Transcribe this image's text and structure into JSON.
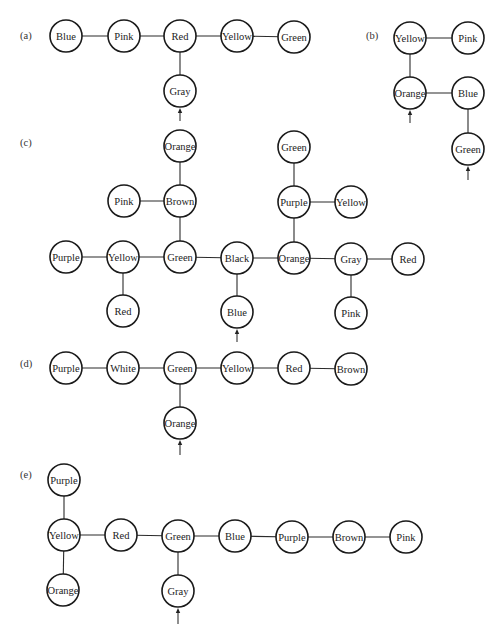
{
  "diagram": {
    "node_radius": 16,
    "panels": [
      {
        "id": "a",
        "label": "(a)",
        "label_pos": [
          20,
          39
        ],
        "nodes": [
          {
            "id": "a1",
            "label": "Blue",
            "x": 66,
            "y": 36
          },
          {
            "id": "a2",
            "label": "Pink",
            "x": 124,
            "y": 36
          },
          {
            "id": "a3",
            "label": "Red",
            "x": 180,
            "y": 36
          },
          {
            "id": "a4",
            "label": "Yellow",
            "x": 237,
            "y": 36
          },
          {
            "id": "a5",
            "label": "Green",
            "x": 294,
            "y": 37
          },
          {
            "id": "a6",
            "label": "Gray",
            "x": 180,
            "y": 91
          }
        ],
        "edges": [
          [
            "a1",
            "a2"
          ],
          [
            "a2",
            "a3"
          ],
          [
            "a3",
            "a4"
          ],
          [
            "a4",
            "a5"
          ],
          [
            "a3",
            "a6"
          ]
        ],
        "arrows": [
          {
            "x": 180,
            "y_top": 108,
            "y_bottom": 121
          }
        ]
      },
      {
        "id": "b",
        "label": "(b)",
        "label_pos": [
          366,
          39
        ],
        "nodes": [
          {
            "id": "b1",
            "label": "Yellow",
            "x": 410,
            "y": 38
          },
          {
            "id": "b2",
            "label": "Pink",
            "x": 468,
            "y": 38
          },
          {
            "id": "b3",
            "label": "Orange",
            "x": 410,
            "y": 93
          },
          {
            "id": "b4",
            "label": "Blue",
            "x": 468,
            "y": 93
          },
          {
            "id": "b5",
            "label": "Green",
            "x": 468,
            "y": 149
          }
        ],
        "edges": [
          [
            "b1",
            "b2"
          ],
          [
            "b1",
            "b3"
          ],
          [
            "b3",
            "b4"
          ],
          [
            "b4",
            "b5"
          ]
        ],
        "arrows": [
          {
            "x": 410,
            "y_top": 110,
            "y_bottom": 123
          },
          {
            "x": 468,
            "y_top": 166,
            "y_bottom": 180
          }
        ]
      },
      {
        "id": "c",
        "label": "(c)",
        "label_pos": [
          20,
          146
        ],
        "nodes": [
          {
            "id": "c1",
            "label": "Orange",
            "x": 180,
            "y": 146
          },
          {
            "id": "c2",
            "label": "Brown",
            "x": 180,
            "y": 201
          },
          {
            "id": "c3",
            "label": "Pink",
            "x": 124,
            "y": 201
          },
          {
            "id": "c4",
            "label": "Purple",
            "x": 66,
            "y": 257
          },
          {
            "id": "c5",
            "label": "Yellow",
            "x": 123,
            "y": 257
          },
          {
            "id": "c6",
            "label": "Green",
            "x": 180,
            "y": 257
          },
          {
            "id": "c7",
            "label": "Black",
            "x": 237,
            "y": 258
          },
          {
            "id": "c8",
            "label": "Orange",
            "x": 294,
            "y": 258
          },
          {
            "id": "c9",
            "label": "Gray",
            "x": 351,
            "y": 259
          },
          {
            "id": "c10",
            "label": "Red",
            "x": 408,
            "y": 259
          },
          {
            "id": "c11",
            "label": "Red",
            "x": 123,
            "y": 311
          },
          {
            "id": "c12",
            "label": "Blue",
            "x": 237,
            "y": 312
          },
          {
            "id": "c13",
            "label": "Pink",
            "x": 351,
            "y": 313
          },
          {
            "id": "c14",
            "label": "Green",
            "x": 294,
            "y": 147
          },
          {
            "id": "c15",
            "label": "Purple",
            "x": 294,
            "y": 202
          },
          {
            "id": "c16",
            "label": "Yellow",
            "x": 351,
            "y": 202
          }
        ],
        "edges": [
          [
            "c1",
            "c2"
          ],
          [
            "c3",
            "c2"
          ],
          [
            "c2",
            "c6"
          ],
          [
            "c4",
            "c5"
          ],
          [
            "c5",
            "c6"
          ],
          [
            "c6",
            "c7"
          ],
          [
            "c7",
            "c8"
          ],
          [
            "c8",
            "c9"
          ],
          [
            "c9",
            "c10"
          ],
          [
            "c5",
            "c11"
          ],
          [
            "c7",
            "c12"
          ],
          [
            "c9",
            "c13"
          ],
          [
            "c14",
            "c15"
          ],
          [
            "c15",
            "c16"
          ],
          [
            "c15",
            "c8"
          ]
        ],
        "arrows": [
          {
            "x": 237,
            "y_top": 329,
            "y_bottom": 342
          }
        ]
      },
      {
        "id": "d",
        "label": "(d)",
        "label_pos": [
          20,
          367
        ],
        "nodes": [
          {
            "id": "d1",
            "label": "Purple",
            "x": 66,
            "y": 368
          },
          {
            "id": "d2",
            "label": "White",
            "x": 123,
            "y": 368
          },
          {
            "id": "d3",
            "label": "Green",
            "x": 180,
            "y": 368
          },
          {
            "id": "d4",
            "label": "Yellow",
            "x": 237,
            "y": 368
          },
          {
            "id": "d5",
            "label": "Red",
            "x": 294,
            "y": 368
          },
          {
            "id": "d6",
            "label": "Brown",
            "x": 351,
            "y": 369
          },
          {
            "id": "d7",
            "label": "Orange",
            "x": 180,
            "y": 423
          }
        ],
        "edges": [
          [
            "d1",
            "d2"
          ],
          [
            "d2",
            "d3"
          ],
          [
            "d3",
            "d4"
          ],
          [
            "d4",
            "d5"
          ],
          [
            "d5",
            "d6"
          ],
          [
            "d3",
            "d7"
          ]
        ],
        "arrows": [
          {
            "x": 180,
            "y_top": 440,
            "y_bottom": 455
          }
        ]
      },
      {
        "id": "e",
        "label": "(e)",
        "label_pos": [
          20,
          478
        ],
        "nodes": [
          {
            "id": "e1",
            "label": "Purple",
            "x": 64,
            "y": 480
          },
          {
            "id": "e2",
            "label": "Yellow",
            "x": 64,
            "y": 535
          },
          {
            "id": "e3",
            "label": "Red",
            "x": 121,
            "y": 535
          },
          {
            "id": "e4",
            "label": "Green",
            "x": 178,
            "y": 536
          },
          {
            "id": "e5",
            "label": "Blue",
            "x": 235,
            "y": 536
          },
          {
            "id": "e6",
            "label": "Purple",
            "x": 292,
            "y": 537
          },
          {
            "id": "e7",
            "label": "Brown",
            "x": 349,
            "y": 537
          },
          {
            "id": "e8",
            "label": "Pink",
            "x": 406,
            "y": 537
          },
          {
            "id": "e9",
            "label": "Orange",
            "x": 63,
            "y": 590
          },
          {
            "id": "e10",
            "label": "Gray",
            "x": 178,
            "y": 591
          }
        ],
        "edges": [
          [
            "e1",
            "e2"
          ],
          [
            "e2",
            "e3"
          ],
          [
            "e3",
            "e4"
          ],
          [
            "e4",
            "e5"
          ],
          [
            "e5",
            "e6"
          ],
          [
            "e6",
            "e7"
          ],
          [
            "e7",
            "e8"
          ],
          [
            "e2",
            "e9"
          ],
          [
            "e4",
            "e10"
          ]
        ],
        "arrows": [
          {
            "x": 178,
            "y_top": 608,
            "y_bottom": 624
          }
        ]
      }
    ]
  },
  "colors": {
    "background": "#ffffff",
    "stroke": "#1a1a1a",
    "text": "#222222"
  }
}
